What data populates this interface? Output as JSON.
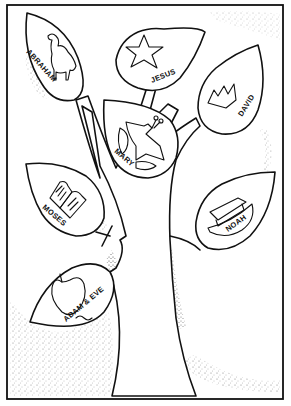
{
  "illustration": {
    "subject": "Bible family tree coloring page",
    "colors": {
      "ink": "#111111",
      "paper": "#ffffff"
    },
    "leaves": [
      {
        "id": "abraham",
        "label": "ABRAHAM",
        "icon": "camel-icon"
      },
      {
        "id": "jesus",
        "label": "JESUS",
        "icon": "star-icon"
      },
      {
        "id": "david",
        "label": "DAVID",
        "icon": "crown-icon"
      },
      {
        "id": "mary",
        "label": "MARY",
        "icon": "dove-icon"
      },
      {
        "id": "moses",
        "label": "MOSES",
        "icon": "tablets-icon"
      },
      {
        "id": "noah",
        "label": "NOAH",
        "icon": "ark-icon"
      },
      {
        "id": "adam-eve",
        "label": "ADAM & EVE",
        "icon": "apple-icon"
      }
    ]
  }
}
